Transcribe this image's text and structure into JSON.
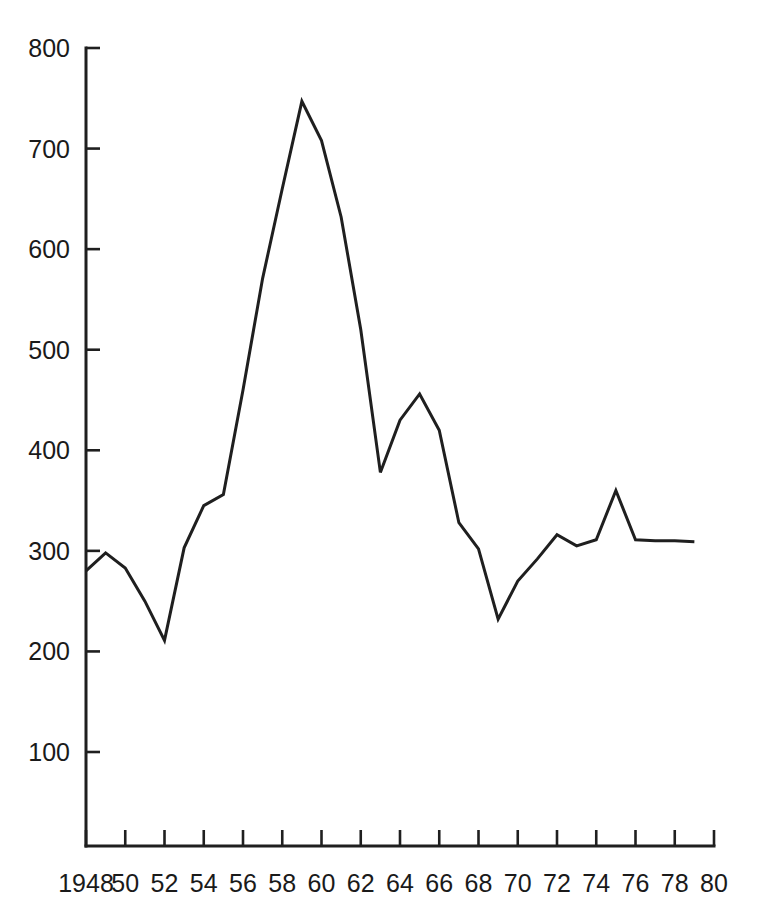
{
  "chart_data": {
    "type": "line",
    "title": "",
    "subtitle": "",
    "xlabel": "",
    "ylabel": "",
    "grid": false,
    "legend": false,
    "legend_position": "none",
    "xlim": [
      1948,
      1980
    ],
    "ylim": [
      0,
      800
    ],
    "y_ticks": [
      100,
      200,
      300,
      400,
      500,
      600,
      700,
      800
    ],
    "y_tick_labels": [
      "100",
      "200",
      "300",
      "400",
      "500",
      "600",
      "700",
      "800"
    ],
    "x_ticks": [
      1948,
      1950,
      1952,
      1954,
      1956,
      1958,
      1960,
      1962,
      1964,
      1966,
      1968,
      1970,
      1972,
      1974,
      1976,
      1978,
      1980
    ],
    "x_tick_labels": [
      "1948",
      "50",
      "52",
      "54",
      "56",
      "58",
      "60",
      "62",
      "64",
      "66",
      "68",
      "70",
      "72",
      "74",
      "76",
      "78",
      "80"
    ],
    "series": [
      {
        "name": "series-1",
        "color": "#1f1f1f",
        "x": [
          1948,
          1949,
          1950,
          1951,
          1952,
          1953,
          1954,
          1955,
          1956,
          1957,
          1958,
          1959,
          1960,
          1961,
          1962,
          1963,
          1964,
          1965,
          1966,
          1967,
          1968,
          1969,
          1970,
          1971,
          1972,
          1973,
          1974,
          1975,
          1976,
          1977,
          1978,
          1979
        ],
        "values": [
          280,
          298,
          283,
          250,
          211,
          303,
          345,
          356,
          460,
          571,
          660,
          747,
          708,
          632,
          520,
          378,
          430,
          456,
          420,
          328,
          302,
          232,
          270,
          292,
          316,
          305,
          311,
          360,
          311,
          310,
          310,
          309
        ]
      }
    ]
  },
  "axes": {
    "y_axis_name": "vertical-value-axis",
    "x_axis_name": "horizontal-year-axis"
  },
  "colors": {
    "line": "#1f1f1f",
    "axis": "#1f1f1f",
    "background": "#ffffff"
  }
}
